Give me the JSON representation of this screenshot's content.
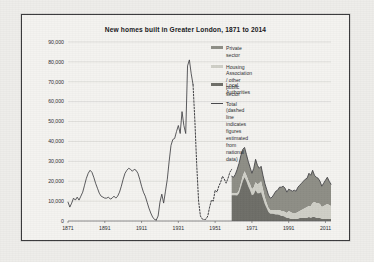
{
  "figure": {
    "title": "New homes built in Greater London, 1871 to 2014",
    "frame_color": "#3a3a3c",
    "background_color": "#f4f3f0"
  },
  "legend": {
    "position": "inside-top-right",
    "entries": [
      {
        "label": "Private sector",
        "swatch": "area",
        "color": "#8e8e86"
      },
      {
        "label": "Housing Association / other public sector",
        "swatch": "area",
        "color": "#cfcfc7"
      },
      {
        "label": "Local Authorities",
        "swatch": "area",
        "color": "#6e6e68"
      },
      {
        "label": "Total (dashed line indicates figures\nestimated from national data)",
        "swatch": "line",
        "color": "#4a4a4d"
      }
    ]
  },
  "chart_data": {
    "type": "area",
    "title": "New homes built in Greater London, 1871 to 2014",
    "xlabel": "",
    "ylabel": "",
    "xlim": [
      1871,
      2014
    ],
    "ylim": [
      0,
      90000
    ],
    "grid": true,
    "x_ticks": [
      1871,
      1891,
      1911,
      1931,
      1951,
      1971,
      1991,
      2011
    ],
    "y_ticks": [
      0,
      10000,
      20000,
      30000,
      40000,
      50000,
      60000,
      70000,
      80000,
      90000
    ],
    "y_tick_labels": [
      "0",
      "10,000",
      "20,000",
      "30,000",
      "40,000",
      "50,000",
      "60,000",
      "70,000",
      "80,000",
      "90,000"
    ],
    "series": [
      {
        "name": "Total",
        "type": "line",
        "style": "solid",
        "color": "#3f3f42",
        "x": [
          1871,
          1872,
          1873,
          1874,
          1875,
          1876,
          1877,
          1878,
          1879,
          1880,
          1881,
          1882,
          1883,
          1884,
          1885,
          1886,
          1887,
          1888,
          1889,
          1890,
          1891,
          1892,
          1893,
          1894,
          1895,
          1896,
          1897,
          1898,
          1899,
          1900,
          1901,
          1902,
          1903,
          1904,
          1905,
          1906,
          1907,
          1908,
          1909,
          1910,
          1911,
          1912,
          1913,
          1914,
          1915,
          1916,
          1917,
          1918,
          1919
        ],
        "y": [
          9500,
          7000,
          9000,
          11500,
          10500,
          12000,
          10500,
          12500,
          14500,
          18000,
          21500,
          24000,
          25500,
          24500,
          22000,
          19000,
          16500,
          14000,
          12500,
          12000,
          11500,
          11500,
          12000,
          11000,
          11500,
          12500,
          11500,
          12500,
          14500,
          17500,
          21000,
          24000,
          25500,
          26500,
          26000,
          25000,
          26000,
          25500,
          24000,
          21000,
          17500,
          14500,
          12500,
          9500,
          6500,
          4000,
          2000,
          800,
          500
        ]
      },
      {
        "name": "Total",
        "type": "line",
        "style": "solid-2",
        "color": "#3f3f42",
        "x": [
          1919,
          1920,
          1921,
          1922,
          1923,
          1924,
          1925,
          1926,
          1927,
          1928,
          1929,
          1930,
          1931,
          1932,
          1933,
          1934,
          1935,
          1936,
          1937,
          1938,
          1939
        ],
        "y": [
          500,
          2500,
          9500,
          13500,
          9000,
          15000,
          21000,
          30000,
          38000,
          41000,
          41500,
          45000,
          48000,
          44000,
          55000,
          48000,
          44000,
          78000,
          81000,
          74000,
          68500
        ]
      },
      {
        "name": "Total (estimated)",
        "type": "line",
        "style": "dashed",
        "color": "#3f3f42",
        "x": [
          1939,
          1940,
          1941,
          1942,
          1943,
          1944,
          1945,
          1946,
          1947,
          1948,
          1949,
          1950,
          1951,
          1952,
          1953,
          1954,
          1955,
          1956,
          1957,
          1958,
          1959,
          1960
        ],
        "y": [
          68500,
          50000,
          28000,
          10000,
          2500,
          1000,
          700,
          900,
          2500,
          7000,
          10500,
          10000,
          15500,
          14500,
          17500,
          19500,
          22500,
          21000,
          19000,
          21500,
          24500,
          26000
        ]
      },
      {
        "name": "Total (post-1960)",
        "type": "line",
        "style": "solid-3",
        "color": "#3f3f42",
        "x": [
          1960,
          1961,
          1962,
          1963,
          1964,
          1965,
          1966,
          1967,
          1968,
          1969,
          1970,
          1971,
          1972,
          1973,
          1974,
          1975,
          1976,
          1977,
          1978,
          1979,
          1980,
          1981,
          1982,
          1983,
          1984,
          1985,
          1986,
          1987,
          1988,
          1989,
          1990,
          1991,
          1992,
          1993,
          1994,
          1995,
          1996,
          1997,
          1998,
          1999,
          2000,
          2001,
          2002,
          2003,
          2004,
          2005,
          2006,
          2007,
          2008,
          2009,
          2010,
          2011,
          2012,
          2013,
          2014
        ],
        "y": [
          22500,
          22000,
          23500,
          26000,
          29000,
          33000,
          36000,
          37000,
          33500,
          30000,
          27000,
          24000,
          26500,
          31000,
          28000,
          26500,
          27500,
          23000,
          19000,
          16000,
          13000,
          11500,
          12000,
          13500,
          15000,
          15500,
          17000,
          17000,
          17500,
          16500,
          14500,
          16000,
          15500,
          15000,
          15500,
          15000,
          17000,
          18000,
          19000,
          20000,
          21000,
          21500,
          24000,
          23000,
          25500,
          23000,
          22000,
          21500,
          20000,
          17500,
          19000,
          20500,
          22000,
          20000,
          18500
        ]
      },
      {
        "name": "Private sector",
        "type": "area-band",
        "color": "#8e8e86",
        "x": [
          1960,
          1961,
          1962,
          1963,
          1964,
          1965,
          1966,
          1967,
          1968,
          1969,
          1970,
          1971,
          1972,
          1973,
          1974,
          1975,
          1976,
          1977,
          1978,
          1979,
          1980,
          1981,
          1982,
          1983,
          1984,
          1985,
          1986,
          1987,
          1988,
          1989,
          1990,
          1991,
          1992,
          1993,
          1994,
          1995,
          1996,
          1997,
          1998,
          1999,
          2000,
          2001,
          2002,
          2003,
          2004,
          2005,
          2006,
          2007,
          2008,
          2009,
          2010,
          2011,
          2012,
          2013,
          2014
        ],
        "y": [
          8500,
          8000,
          9500,
          12000,
          13500,
          14000,
          13500,
          12000,
          10500,
          9500,
          8500,
          8000,
          9500,
          11500,
          9500,
          7500,
          7500,
          7000,
          7000,
          7000,
          6500,
          6000,
          6500,
          8000,
          9500,
          10000,
          11500,
          12000,
          12500,
          12000,
          10500,
          11000,
          11000,
          11000,
          11500,
          11000,
          12500,
          13000,
          13500,
          14000,
          14500,
          14500,
          16500,
          15500,
          16500,
          13500,
          13000,
          12500,
          11500,
          10500,
          11500,
          12500,
          13500,
          12000,
          11000
        ]
      },
      {
        "name": "Housing Association / other public sector",
        "type": "area-band",
        "color": "#cfcfc7",
        "x": [
          1960,
          1961,
          1962,
          1963,
          1964,
          1965,
          1966,
          1967,
          1968,
          1969,
          1970,
          1971,
          1972,
          1973,
          1974,
          1975,
          1976,
          1977,
          1978,
          1979,
          1980,
          1981,
          1982,
          1983,
          1984,
          1985,
          1986,
          1987,
          1988,
          1989,
          1990,
          1991,
          1992,
          1993,
          1994,
          1995,
          1996,
          1997,
          1998,
          1999,
          2000,
          2001,
          2002,
          2003,
          2004,
          2005,
          2006,
          2007,
          2008,
          2009,
          2010,
          2011,
          2012,
          2013,
          2014
        ],
        "y": [
          1000,
          1000,
          1000,
          1200,
          1500,
          2000,
          2500,
          3000,
          3000,
          3000,
          3000,
          3000,
          3500,
          4000,
          4500,
          5000,
          5500,
          4500,
          3500,
          2500,
          2000,
          1800,
          1800,
          2000,
          2200,
          2200,
          2500,
          2500,
          2500,
          2500,
          2500,
          3500,
          3500,
          3000,
          3000,
          3000,
          3500,
          3500,
          4000,
          4500,
          5000,
          5500,
          5500,
          6000,
          7000,
          7500,
          7500,
          7500,
          7000,
          6000,
          6500,
          7000,
          7500,
          7000,
          6500
        ]
      },
      {
        "name": "Local Authorities",
        "type": "area-band",
        "color": "#6e6e68",
        "x": [
          1960,
          1961,
          1962,
          1963,
          1964,
          1965,
          1966,
          1967,
          1968,
          1969,
          1970,
          1971,
          1972,
          1973,
          1974,
          1975,
          1976,
          1977,
          1978,
          1979,
          1980,
          1981,
          1982,
          1983,
          1984,
          1985,
          1986,
          1987,
          1988,
          1989,
          1990,
          1991,
          1992,
          1993,
          1994,
          1995,
          1996,
          1997,
          1998,
          1999,
          2000,
          2001,
          2002,
          2003,
          2004,
          2005,
          2006,
          2007,
          2008,
          2009,
          2010,
          2011,
          2012,
          2013,
          2014
        ],
        "y": [
          13000,
          13000,
          13000,
          12800,
          14000,
          17000,
          20000,
          22000,
          20000,
          17500,
          15500,
          13000,
          13500,
          15500,
          14000,
          14000,
          14500,
          11500,
          8500,
          6500,
          4500,
          3700,
          3700,
          3500,
          3300,
          3300,
          3000,
          2500,
          2500,
          2000,
          1500,
          1500,
          1000,
          1000,
          1000,
          1000,
          1000,
          1500,
          1500,
          1500,
          1500,
          1500,
          2000,
          1500,
          2000,
          2000,
          1500,
          1500,
          1500,
          1000,
          1000,
          1000,
          1000,
          1000,
          1000
        ]
      }
    ]
  }
}
